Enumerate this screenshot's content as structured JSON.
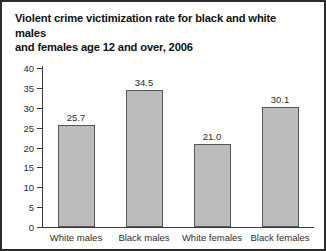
{
  "chart_data": {
    "type": "bar",
    "title": "Violent crime victimization rate for black and white males and females age 12 and over, 2006",
    "title_line1": "Violent crime victimization rate for black and white males",
    "title_line2": "and females age 12 and over, 2006",
    "categories": [
      "White males",
      "Black males",
      "White females",
      "Black females"
    ],
    "values": [
      25.7,
      34.5,
      21.0,
      30.1
    ],
    "value_labels": [
      "25.7",
      "34.5",
      "21.0",
      "30.1"
    ],
    "xlabel": "",
    "ylabel": "",
    "ylim": [
      0,
      40
    ],
    "yticks": [
      0,
      5,
      10,
      15,
      20,
      25,
      30,
      35,
      40
    ],
    "ytick_labels": [
      "0",
      "5",
      "10",
      "15",
      "20",
      "25",
      "30",
      "35",
      "40"
    ],
    "grid": false,
    "legend": false,
    "bar_color": "#bcbcbc",
    "bar_edge_color": "#575757",
    "axis_color": "#3a3a3a",
    "text_color": "#2d2d2d",
    "background_color": "#ffffff",
    "border_color": "#2b2b2b"
  }
}
